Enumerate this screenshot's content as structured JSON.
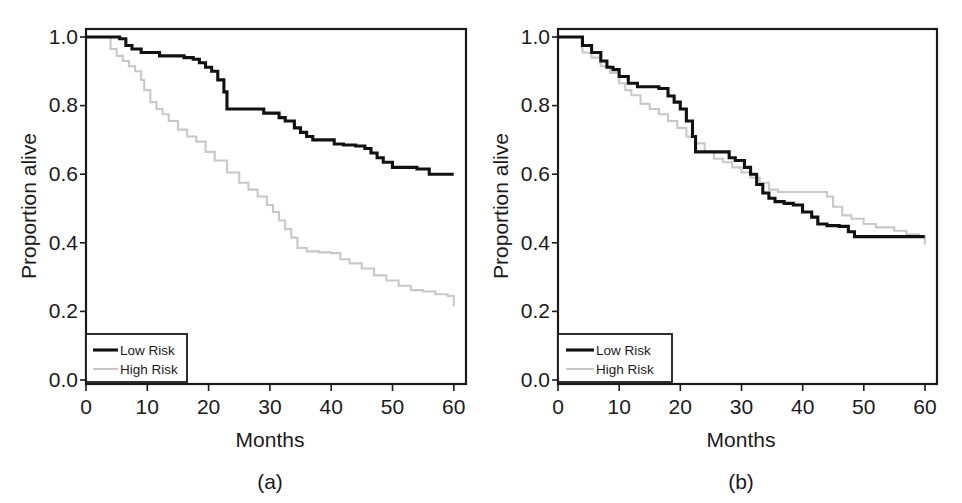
{
  "figure": {
    "panels": [
      {
        "caption": "(a)",
        "xlabel": "Months",
        "ylabel": "Proportion alive",
        "xticks": [
          "0",
          "10",
          "20",
          "30",
          "40",
          "50",
          "60"
        ],
        "yticks": [
          "0.0",
          "0.2",
          "0.4",
          "0.6",
          "0.8",
          "1.0"
        ],
        "legend": {
          "low": "Low Risk",
          "high": "High Risk"
        }
      },
      {
        "caption": "(b)",
        "xlabel": "Months",
        "ylabel": "Proportion alive",
        "xticks": [
          "0",
          "10",
          "20",
          "30",
          "40",
          "50",
          "60"
        ],
        "yticks": [
          "0.0",
          "0.2",
          "0.4",
          "0.6",
          "0.8",
          "1.0"
        ],
        "legend": {
          "low": "Low Risk",
          "high": "High Risk"
        }
      }
    ]
  },
  "colors": {
    "low_risk_line": "#111111",
    "high_risk_line": "#c8c8c8",
    "axis": "#1a1a1a",
    "background": "#ffffff"
  },
  "chart_data": [
    {
      "type": "line",
      "subtype": "kaplan-meier-step",
      "panel": "(a)",
      "title": "",
      "xlabel": "Months",
      "ylabel": "Proportion alive",
      "xlim": [
        0,
        62
      ],
      "ylim": [
        0.0,
        1.05
      ],
      "xticks": [
        0,
        10,
        20,
        30,
        40,
        50,
        60
      ],
      "yticks": [
        0.0,
        0.2,
        0.4,
        0.6,
        0.8,
        1.0
      ],
      "grid": false,
      "legend_position": "bottom-left",
      "series": [
        {
          "name": "Low Risk",
          "color": "#111111",
          "x": [
            0,
            3,
            5.5,
            6.5,
            7.5,
            9,
            12,
            16,
            17.5,
            18.5,
            19.5,
            20.5,
            21.5,
            22.5,
            23,
            29,
            30.5,
            31.5,
            32.5,
            34,
            35,
            36,
            37,
            40.5,
            42,
            44,
            45.5,
            46.5,
            47.5,
            48.5,
            50,
            54,
            56,
            60
          ],
          "y": [
            1.0,
            1.0,
            0.995,
            0.975,
            0.965,
            0.955,
            0.945,
            0.94,
            0.935,
            0.925,
            0.912,
            0.9,
            0.875,
            0.84,
            0.79,
            0.778,
            0.778,
            0.765,
            0.755,
            0.735,
            0.722,
            0.71,
            0.7,
            0.688,
            0.685,
            0.682,
            0.675,
            0.662,
            0.648,
            0.635,
            0.62,
            0.615,
            0.6,
            0.6
          ]
        },
        {
          "name": "High Risk",
          "color": "#c8c8c8",
          "x": [
            0,
            2.5,
            4,
            5,
            6,
            7,
            8,
            9,
            9.5,
            10.5,
            11.5,
            12.5,
            13.5,
            15,
            16.5,
            18,
            19.5,
            21,
            23,
            25,
            26.5,
            28,
            29.5,
            30.5,
            31.5,
            32.5,
            33.5,
            34.5,
            36,
            38,
            40,
            41.5,
            43,
            45,
            47,
            49,
            51,
            53,
            55,
            57,
            59,
            60
          ],
          "y": [
            1.0,
            1.0,
            0.965,
            0.945,
            0.93,
            0.915,
            0.9,
            0.875,
            0.845,
            0.81,
            0.79,
            0.775,
            0.755,
            0.73,
            0.71,
            0.695,
            0.665,
            0.64,
            0.605,
            0.575,
            0.555,
            0.535,
            0.51,
            0.49,
            0.465,
            0.44,
            0.415,
            0.385,
            0.375,
            0.372,
            0.37,
            0.352,
            0.34,
            0.325,
            0.305,
            0.29,
            0.275,
            0.262,
            0.258,
            0.25,
            0.245,
            0.215
          ]
        }
      ]
    },
    {
      "type": "line",
      "subtype": "kaplan-meier-step",
      "panel": "(b)",
      "title": "",
      "xlabel": "Months",
      "ylabel": "Proportion alive",
      "xlim": [
        0,
        62
      ],
      "ylim": [
        0.0,
        1.05
      ],
      "xticks": [
        0,
        10,
        20,
        30,
        40,
        50,
        60
      ],
      "yticks": [
        0.0,
        0.2,
        0.4,
        0.6,
        0.8,
        1.0
      ],
      "grid": false,
      "legend_position": "bottom-left",
      "series": [
        {
          "name": "Low Risk",
          "color": "#111111",
          "x": [
            0,
            3,
            4,
            5.5,
            7,
            8,
            9,
            10,
            11.5,
            13,
            15,
            16.5,
            18,
            19,
            20,
            21,
            22,
            22.5,
            26.5,
            28,
            29,
            30.5,
            31.5,
            32.5,
            33.5,
            34.5,
            35.5,
            37,
            38.5,
            40,
            41.5,
            42.5,
            44,
            46,
            47.5,
            48.5,
            55,
            60
          ],
          "y": [
            1.0,
            1.0,
            0.975,
            0.955,
            0.93,
            0.912,
            0.905,
            0.885,
            0.865,
            0.855,
            0.855,
            0.85,
            0.828,
            0.81,
            0.79,
            0.755,
            0.71,
            0.665,
            0.665,
            0.648,
            0.64,
            0.62,
            0.6,
            0.57,
            0.545,
            0.53,
            0.52,
            0.515,
            0.51,
            0.49,
            0.475,
            0.455,
            0.45,
            0.448,
            0.432,
            0.418,
            0.418,
            0.418
          ]
        },
        {
          "name": "High Risk",
          "color": "#c8c8c8",
          "x": [
            0,
            2.5,
            4,
            5.5,
            7,
            8.5,
            10,
            11,
            12,
            13.5,
            15,
            16.5,
            18,
            19.5,
            21,
            22.5,
            24,
            25.5,
            27,
            28.5,
            30,
            31.5,
            33,
            34.5,
            36,
            38,
            40,
            42,
            44,
            45,
            46.5,
            48,
            50,
            52,
            55,
            57,
            59,
            60
          ],
          "y": [
            1.0,
            1.0,
            0.955,
            0.94,
            0.915,
            0.895,
            0.865,
            0.845,
            0.83,
            0.805,
            0.79,
            0.775,
            0.755,
            0.735,
            0.71,
            0.69,
            0.665,
            0.645,
            0.635,
            0.62,
            0.605,
            0.59,
            0.575,
            0.555,
            0.548,
            0.548,
            0.548,
            0.548,
            0.535,
            0.505,
            0.48,
            0.47,
            0.455,
            0.445,
            0.435,
            0.425,
            0.418,
            0.395
          ]
        }
      ]
    }
  ]
}
